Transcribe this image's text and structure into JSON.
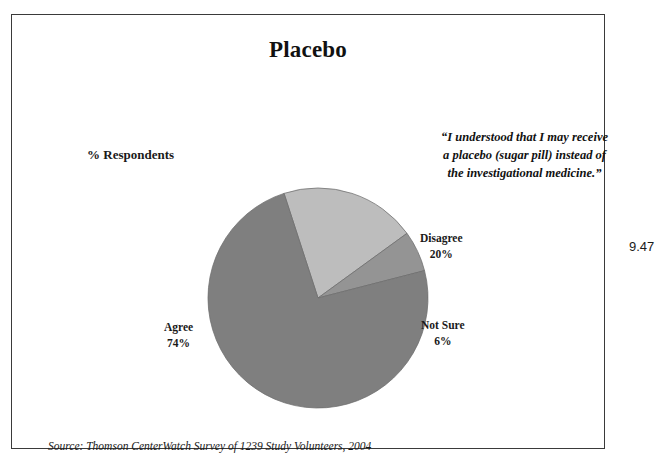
{
  "figure": {
    "number": "9.47",
    "title": "Placebo",
    "axis_label": "% Respondents",
    "quote": "“I understood that I may receive a placebo (sugar pill) instead of the investigational medicine.”",
    "source": "Source: Thomson CenterWatch Survey of 1239 Study Volunteers, 2004"
  },
  "chart_data": {
    "type": "pie",
    "title": "Placebo",
    "ylabel": "% Respondents",
    "legend_position": "callout-labels",
    "start_angle_deg": -18,
    "direction": "clockwise",
    "categories": [
      "Disagree",
      "Not Sure",
      "Agree"
    ],
    "values": [
      20,
      6,
      74
    ],
    "unit": "%",
    "slices": [
      {
        "name": "Disagree",
        "value": 20,
        "value_label": "20%",
        "color": "#bdbdbd",
        "start_deg": -18,
        "sweep_deg": 72
      },
      {
        "name": "Not Sure",
        "value": 6,
        "value_label": "6%",
        "color": "#949494",
        "start_deg": 54,
        "sweep_deg": 21.6
      },
      {
        "name": "Agree",
        "value": 74,
        "value_label": "74%",
        "color": "#7f7f7f",
        "start_deg": 75.6,
        "sweep_deg": 266.4
      }
    ],
    "annotations": [
      "“I understood that I may receive a placebo (sugar pill) instead of the investigational medicine.”",
      "Source: Thomson CenterWatch Survey of 1239 Study Volunteers, 2004"
    ]
  },
  "labels": {
    "disagree_name": "Disagree",
    "disagree_value": "20%",
    "notsure_name": "Not Sure",
    "notsure_value": "6%",
    "agree_name": "Agree",
    "agree_value": "74%"
  },
  "colors": {
    "slice_agree": "#7f7f7f",
    "slice_disagree": "#bdbdbd",
    "slice_notsure": "#949494",
    "frame_border": "#3a3a3a",
    "text": "#1a1a1a",
    "background": "#ffffff"
  }
}
